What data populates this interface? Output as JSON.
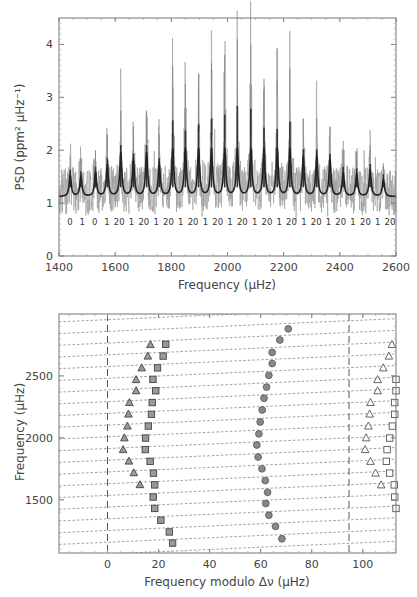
{
  "chart_data": [
    {
      "type": "line",
      "title": "",
      "xlabel": "Frequency (μHz)",
      "ylabel": "PSD (ppm² μHz⁻¹)",
      "xlim": [
        1400,
        2600
      ],
      "ylim": [
        0,
        4.5
      ],
      "xticks": [
        1400,
        1600,
        1800,
        2000,
        2200,
        2400,
        2600
      ],
      "yticks": [
        0,
        1,
        2,
        3,
        4
      ],
      "grid": false,
      "series": [
        {
          "name": "PSD (raw)",
          "color": "#999999",
          "peaks": [
            {
              "x": 1440,
              "y": 1.9
            },
            {
              "x": 1478,
              "y": 1.85
            },
            {
              "x": 1530,
              "y": 2.0
            },
            {
              "x": 1572,
              "y": 2.3
            },
            {
              "x": 1620,
              "y": 2.75
            },
            {
              "x": 1665,
              "y": 2.45
            },
            {
              "x": 1712,
              "y": 2.75
            },
            {
              "x": 1757,
              "y": 2.3
            },
            {
              "x": 1805,
              "y": 3.6
            },
            {
              "x": 1850,
              "y": 3.25
            },
            {
              "x": 1897,
              "y": 3.45
            },
            {
              "x": 1943,
              "y": 3.65
            },
            {
              "x": 1990,
              "y": 3.8
            },
            {
              "x": 2035,
              "y": 4.1
            },
            {
              "x": 2083,
              "y": 4.0
            },
            {
              "x": 2130,
              "y": 3.35
            },
            {
              "x": 2177,
              "y": 3.3
            },
            {
              "x": 2222,
              "y": 3.55
            },
            {
              "x": 2270,
              "y": 2.6
            },
            {
              "x": 2318,
              "y": 2.6
            },
            {
              "x": 2365,
              "y": 2.45
            },
            {
              "x": 2412,
              "y": 2.0
            },
            {
              "x": 2460,
              "y": 1.95
            },
            {
              "x": 2508,
              "y": 2.1
            },
            {
              "x": 2555,
              "y": 1.75
            }
          ],
          "baseline": 1.2
        },
        {
          "name": "Smoothed PSD / fit",
          "color": "#222222",
          "baseline": 1.1
        }
      ],
      "annotations": {
        "mode_degree_labels": [
          "0",
          "1",
          "0",
          "1",
          "20",
          "1",
          "20",
          "1",
          "20",
          "1",
          "20",
          "1",
          "20",
          "1",
          "20",
          "1",
          "20",
          "1",
          "20",
          "1",
          "20",
          "1",
          "20",
          "1",
          "20",
          "1",
          "20"
        ],
        "label_y": 0.65
      }
    },
    {
      "type": "scatter",
      "title": "",
      "xlabel": "Frequency modulo Δν (μHz)",
      "ylabel": "Frequency (μHz)",
      "xlim": [
        -19,
        113
      ],
      "ylim": [
        1070,
        3000
      ],
      "xticks": [
        0,
        20,
        40,
        60,
        80,
        100
      ],
      "yticks": [
        1500,
        2000,
        2500
      ],
      "grid": false,
      "vertical_dashed_lines": [
        0,
        94.6
      ],
      "series": [
        {
          "name": "l=0 (squares, filled)",
          "marker": "square",
          "fill": "#999999",
          "points": [
            [
              25.5,
              1150
            ],
            [
              24.2,
              1240
            ],
            [
              20.9,
              1335
            ],
            [
              18.5,
              1430
            ],
            [
              17.9,
              1522
            ],
            [
              18.5,
              1620
            ],
            [
              18.0,
              1715
            ],
            [
              16.7,
              1810
            ],
            [
              14.8,
              1905
            ],
            [
              14.9,
              1998
            ],
            [
              16.0,
              2095
            ],
            [
              17.2,
              2190
            ],
            [
              17.5,
              2285
            ],
            [
              18.9,
              2380
            ],
            [
              17.8,
              2472
            ],
            [
              19.6,
              2565
            ],
            [
              21.8,
              2660
            ],
            [
              22.8,
              2755
            ]
          ]
        },
        {
          "name": "l=2 (triangles, filled)",
          "marker": "triangle",
          "fill": "#999999",
          "points": [
            [
              12.7,
              1622
            ],
            [
              10.3,
              1718
            ],
            [
              8.4,
              1812
            ],
            [
              6.1,
              1905
            ],
            [
              6.6,
              2000
            ],
            [
              7.8,
              2095
            ],
            [
              8.2,
              2192
            ],
            [
              8.6,
              2285
            ],
            [
              11.2,
              2380
            ],
            [
              11.2,
              2470
            ],
            [
              13.4,
              2565
            ],
            [
              15.8,
              2660
            ],
            [
              16.8,
              2753
            ]
          ]
        },
        {
          "name": "l=1 (circles, filled)",
          "marker": "circle",
          "fill": "#888888",
          "points": [
            [
              68.3,
              1185
            ],
            [
              65.8,
              1285
            ],
            [
              63.2,
              1375
            ],
            [
              62.0,
              1470
            ],
            [
              62.7,
              1560
            ],
            [
              61.8,
              1655
            ],
            [
              60.5,
              1750
            ],
            [
              59.0,
              1845
            ],
            [
              58.5,
              1942
            ],
            [
              59.3,
              2032
            ],
            [
              59.8,
              2128
            ],
            [
              60.6,
              2225
            ],
            [
              61.3,
              2320
            ],
            [
              62.3,
              2410
            ],
            [
              63.2,
              2505
            ],
            [
              64.5,
              2600
            ],
            [
              64.5,
              2690
            ],
            [
              67.5,
              2790
            ],
            [
              70.8,
              2880
            ]
          ]
        },
        {
          "name": "l=0 shifted (open squares)",
          "marker": "square",
          "fill": "none",
          "points": [
            [
              113,
              1430
            ],
            [
              112.5,
              1522
            ],
            [
              112.3,
              1620
            ],
            [
              110.5,
              1715
            ],
            [
              109.2,
              1810
            ],
            [
              109.5,
              1905
            ],
            [
              110.5,
              1998
            ],
            [
              111.6,
              2095
            ],
            [
              112.5,
              2190
            ],
            [
              112.5,
              2285
            ],
            [
              113,
              2380
            ],
            [
              113,
              2472
            ]
          ]
        },
        {
          "name": "l=2 shifted (open triangles)",
          "marker": "triangle",
          "fill": "none",
          "points": [
            [
              107.2,
              1620
            ],
            [
              105.0,
              1715
            ],
            [
              103.0,
              1810
            ],
            [
              100.9,
              1905
            ],
            [
              101.3,
              2000
            ],
            [
              102.2,
              2095
            ],
            [
              102.7,
              2192
            ],
            [
              103.0,
              2285
            ],
            [
              105.8,
              2380
            ],
            [
              105.8,
              2470
            ],
            [
              108.0,
              2565
            ],
            [
              110.2,
              2660
            ],
            [
              111.4,
              2753
            ]
          ]
        }
      ]
    }
  ]
}
